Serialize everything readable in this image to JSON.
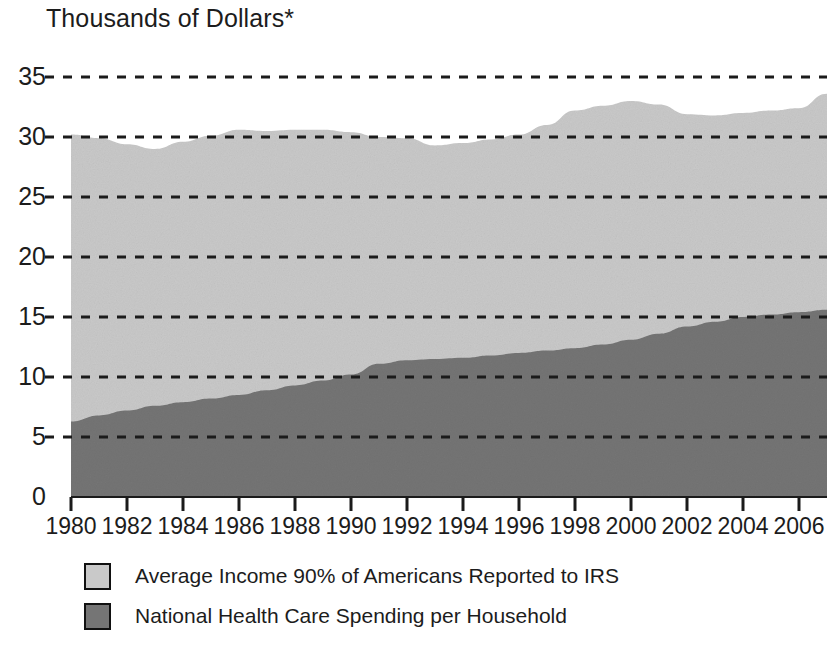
{
  "chart_data": {
    "type": "area",
    "title": "Thousands of Dollars*",
    "xlabel": "",
    "ylabel": "",
    "stacked": false,
    "grid": true,
    "grid_style": "dashed-horizontal",
    "legend_position": "below-plot-left",
    "xlim": [
      1980,
      2007
    ],
    "ylim": [
      0,
      35.8
    ],
    "yticks": [
      0,
      5,
      10,
      15,
      20,
      25,
      30,
      35
    ],
    "ytick_labels": [
      "0",
      "5",
      "10",
      "15",
      "20",
      "25",
      "30",
      "35"
    ],
    "xticks": [
      1980,
      1982,
      1984,
      1986,
      1988,
      1990,
      1992,
      1994,
      1996,
      1998,
      2000,
      2002,
      2004,
      2006
    ],
    "xtick_labels": [
      "1980",
      "1982",
      "1984",
      "1986",
      "1988",
      "1990",
      "1992",
      "1994",
      "1996",
      "1998",
      "2000",
      "2002",
      "2004",
      "2006"
    ],
    "x": [
      1980,
      1981,
      1982,
      1983,
      1984,
      1985,
      1986,
      1987,
      1988,
      1989,
      1990,
      1991,
      1992,
      1993,
      1994,
      1995,
      1996,
      1997,
      1998,
      1999,
      2000,
      2001,
      2002,
      2003,
      2004,
      2005,
      2006,
      2007
    ],
    "series": [
      {
        "name": "Average Income 90% of Americans Reported to IRS",
        "color": "#c9c9c9",
        "values": [
          30.2,
          29.9,
          29.4,
          29.0,
          29.6,
          30.1,
          30.6,
          30.5,
          30.6,
          30.6,
          30.4,
          30.0,
          29.9,
          29.3,
          29.5,
          29.8,
          30.2,
          31.0,
          32.2,
          32.6,
          33.0,
          32.7,
          31.9,
          31.8,
          32.0,
          32.2,
          32.4,
          33.6
        ]
      },
      {
        "name": "National Health Care Spending per Household",
        "color": "#757575",
        "values": [
          6.3,
          6.8,
          7.2,
          7.6,
          7.9,
          8.2,
          8.5,
          8.9,
          9.3,
          9.7,
          10.2,
          11.1,
          11.4,
          11.5,
          11.6,
          11.8,
          12.0,
          12.2,
          12.4,
          12.7,
          13.1,
          13.6,
          14.2,
          14.6,
          15.0,
          15.2,
          15.4,
          15.6
        ]
      }
    ],
    "legend": [
      {
        "label": "Average Income 90% of Americans Reported to IRS",
        "color": "#c9c9c9"
      },
      {
        "label": "National Health Care Spending per Household",
        "color": "#757575"
      }
    ]
  }
}
